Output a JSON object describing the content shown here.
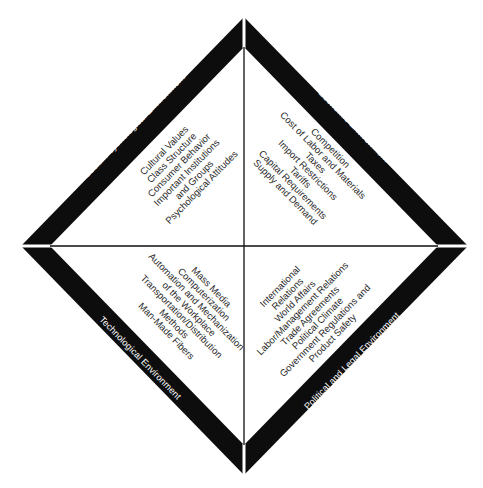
{
  "diagram": {
    "type": "quadrant-diamond",
    "colors": {
      "band": "#0d0d0d",
      "background": "#ffffff",
      "divider": "#111111",
      "text": "#2a2a2a",
      "band_text": "#ffffff"
    },
    "quadrants": {
      "top_left": {
        "title": "Social/Psychological Environment",
        "items": [
          "Cultural Values",
          "Class Structure",
          "Consumer Behavior",
          "Important Institutions",
          "and Groups",
          "Psychological Attitudes"
        ]
      },
      "top_right": {
        "title": "Economic Environment",
        "items": [
          "Competition",
          "Cost of Labor and Materials",
          "Taxes",
          "Import Restrictions",
          "Tariffs",
          "Capital Requirements",
          "Supply and Demand"
        ]
      },
      "bottom_left": {
        "title": "Technological Environment",
        "items": [
          "Mass Media",
          "Computerization",
          "Automation and Mechanization",
          "of the Workplace",
          "Transportation/Distribution",
          "Methods",
          "Man-Made Fibers"
        ]
      },
      "bottom_right": {
        "title": "Political and Legal Environment",
        "items": [
          "International",
          "Relations",
          "World Affairs",
          "Labor/Management Relations",
          "Trade Agreements",
          "Political Climate",
          "Government Regulations and",
          "Product Safety"
        ]
      }
    }
  }
}
